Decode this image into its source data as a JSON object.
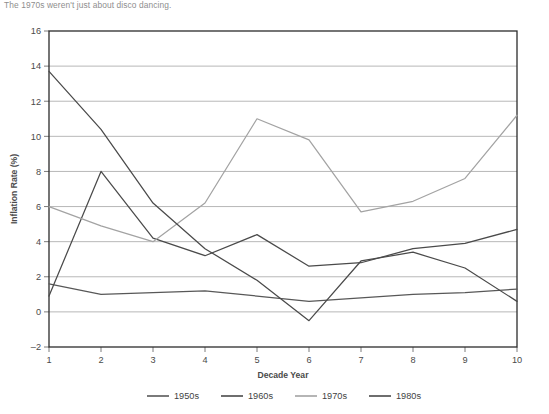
{
  "caption": "The 1970s weren't just about disco dancing.",
  "chart_data": {
    "type": "line",
    "title": "",
    "xlabel": "Decade Year",
    "ylabel": "Inflation Rate (%)",
    "x": [
      1,
      2,
      3,
      4,
      5,
      6,
      7,
      8,
      9,
      10
    ],
    "xlim": [
      1,
      10
    ],
    "ylim": [
      -2,
      16
    ],
    "xticks": [
      "1",
      "2",
      "3",
      "4",
      "5",
      "6",
      "7",
      "8",
      "9",
      "10"
    ],
    "yticks": [
      "-2",
      "0",
      "2",
      "4",
      "6",
      "8",
      "10",
      "12",
      "14",
      "16"
    ],
    "grid": "horizontal",
    "legend_position": "bottom",
    "series": [
      {
        "name": "1950s",
        "color": "#585858",
        "values": [
          1.6,
          1.0,
          1.1,
          1.2,
          0.9,
          0.6,
          0.8,
          1.0,
          1.1,
          1.3
        ]
      },
      {
        "name": "1960s",
        "color": "#4a4a4a",
        "values": [
          0.9,
          8.0,
          4.2,
          3.2,
          4.4,
          2.6,
          2.8,
          3.6,
          3.9,
          4.7
        ]
      },
      {
        "name": "1970s",
        "color": "#a3a3a3",
        "values": [
          6.0,
          4.9,
          4.0,
          6.2,
          11.0,
          9.8,
          5.7,
          6.3,
          7.6,
          11.2
        ]
      },
      {
        "name": "1980s",
        "color": "#4a4a4a",
        "values": [
          13.7,
          10.4,
          6.2,
          3.6,
          1.8,
          -0.5,
          2.9,
          3.4,
          2.5,
          0.6
        ]
      }
    ]
  }
}
